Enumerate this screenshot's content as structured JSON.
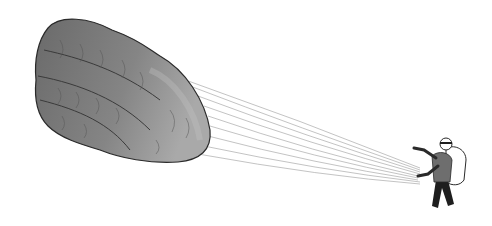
{
  "illustration": {
    "description": "Hand-drawn sketch of a person holding lines attached to a large inflated paraglider-like canopy shaped like a fish fillet",
    "subjects": [
      "canopy",
      "lines",
      "person"
    ],
    "colors": {
      "background": "#ffffff",
      "canopy_fill": "#7a7a7a",
      "canopy_dark": "#555555",
      "canopy_light": "#b8b8b8",
      "outline": "#2a2a2a",
      "lines": "#9a9a9a",
      "jacket": "#6e6e6e",
      "pants": "#1e1e1e",
      "backpack": "#ffffff"
    }
  }
}
